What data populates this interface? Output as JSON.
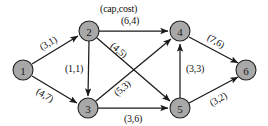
{
  "diagram": {
    "type": "network-flow-graph",
    "legend": {
      "caption": "(cap,cost)"
    },
    "node_style": {
      "fill": "#a8a8a8",
      "stroke": "#222222",
      "radius": 10
    },
    "nodes": [
      {
        "id": "1",
        "label": "1",
        "x": 23,
        "y": 70
      },
      {
        "id": "2",
        "label": "2",
        "x": 89,
        "y": 31
      },
      {
        "id": "3",
        "label": "3",
        "x": 88,
        "y": 108
      },
      {
        "id": "4",
        "label": "4",
        "x": 180,
        "y": 31
      },
      {
        "id": "5",
        "label": "5",
        "x": 180,
        "y": 108
      },
      {
        "id": "6",
        "label": "6",
        "x": 246,
        "y": 70
      }
    ],
    "edges": [
      {
        "from": "1",
        "to": "2",
        "cap": 3,
        "cost": 1,
        "label": "(3,1)",
        "lx": 48,
        "ly": 43,
        "rot": -30
      },
      {
        "from": "1",
        "to": "3",
        "cap": 4,
        "cost": 7,
        "label": "(4,7)",
        "lx": 45,
        "ly": 95,
        "rot": 31
      },
      {
        "from": "2",
        "to": "3",
        "cap": 1,
        "cost": 1,
        "label": "(1,1)",
        "lx": 74,
        "ly": 68,
        "rot": 0
      },
      {
        "from": "2",
        "to": "4",
        "cap": 6,
        "cost": 4,
        "label": "(6,4)",
        "lx": 130,
        "ly": 20,
        "rot": 0
      },
      {
        "from": "2",
        "to": "5",
        "cap": 4,
        "cost": 5,
        "label": "(4,5)",
        "lx": 119,
        "ly": 50,
        "rot": 40
      },
      {
        "from": "3",
        "to": "4",
        "cap": 5,
        "cost": 3,
        "label": "(5,3)",
        "lx": 122,
        "ly": 88,
        "rot": -40
      },
      {
        "from": "3",
        "to": "5",
        "cap": 3,
        "cost": 6,
        "label": "(3,6)",
        "lx": 133,
        "ly": 118,
        "rot": 0
      },
      {
        "from": "5",
        "to": "4",
        "cap": 3,
        "cost": 3,
        "label": "(3,3)",
        "lx": 195,
        "ly": 68,
        "rot": 0
      },
      {
        "from": "4",
        "to": "6",
        "cap": 7,
        "cost": 6,
        "label": "(7,6)",
        "lx": 216,
        "ly": 41,
        "rot": 31
      },
      {
        "from": "5",
        "to": "6",
        "cap": 3,
        "cost": 2,
        "label": "(3,2)",
        "lx": 218,
        "ly": 99,
        "rot": -30
      }
    ]
  }
}
